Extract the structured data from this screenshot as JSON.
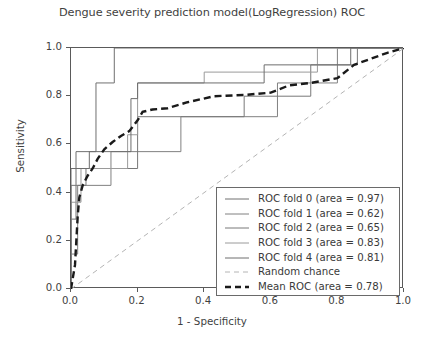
{
  "chart_data": {
    "type": "line",
    "title": "Dengue severity prediction model(LogRegression) ROC",
    "xlabel": "1 - Specificity",
    "ylabel": "Sensitivity",
    "xlim": [
      0.0,
      1.0
    ],
    "ylim": [
      0.0,
      1.0
    ],
    "xticks": [
      "0.0",
      "0.2",
      "0.4",
      "0.6",
      "0.8",
      "1.0"
    ],
    "yticks": [
      "0.0",
      "0.2",
      "0.4",
      "0.6",
      "0.8",
      "1.0"
    ],
    "grid": false,
    "legend_position": "lower right",
    "series": [
      {
        "name": "ROC fold 0 (area = 0.97)",
        "area": 0.97,
        "style": "step-solid",
        "color": "#707070",
        "width": 1.0,
        "points": [
          [
            0.0,
            0.0
          ],
          [
            0.0,
            0.29
          ],
          [
            0.015,
            0.29
          ],
          [
            0.015,
            0.57
          ],
          [
            0.075,
            0.57
          ],
          [
            0.075,
            0.855
          ],
          [
            0.13,
            0.855
          ],
          [
            0.13,
            1.0
          ],
          [
            1.0,
            1.0
          ]
        ]
      },
      {
        "name": "ROC fold 1 (area = 0.62)",
        "area": 0.62,
        "style": "step-solid",
        "color": "#808080",
        "width": 1.0,
        "points": [
          [
            0.0,
            0.0
          ],
          [
            0.0,
            0.145
          ],
          [
            0.02,
            0.145
          ],
          [
            0.02,
            0.43
          ],
          [
            0.12,
            0.43
          ],
          [
            0.12,
            0.57
          ],
          [
            0.33,
            0.57
          ],
          [
            0.33,
            0.715
          ],
          [
            0.62,
            0.715
          ],
          [
            0.62,
            0.855
          ],
          [
            0.8,
            0.855
          ],
          [
            0.8,
            1.0
          ],
          [
            1.0,
            1.0
          ]
        ]
      },
      {
        "name": "ROC fold 2 (area = 0.65)",
        "area": 0.65,
        "style": "step-solid",
        "color": "#787878",
        "width": 1.0,
        "points": [
          [
            0.0,
            0.0
          ],
          [
            0.0,
            0.43
          ],
          [
            0.045,
            0.43
          ],
          [
            0.045,
            0.5
          ],
          [
            0.2,
            0.5
          ],
          [
            0.2,
            0.715
          ],
          [
            0.52,
            0.715
          ],
          [
            0.52,
            0.8
          ],
          [
            0.72,
            0.8
          ],
          [
            0.72,
            0.93
          ],
          [
            0.86,
            0.93
          ],
          [
            0.86,
            1.0
          ],
          [
            1.0,
            1.0
          ]
        ]
      },
      {
        "name": "ROC fold 3 (area = 0.83)",
        "area": 0.83,
        "style": "step-solid",
        "color": "#9a9a9a",
        "width": 1.0,
        "points": [
          [
            0.0,
            0.0
          ],
          [
            0.0,
            0.36
          ],
          [
            0.03,
            0.36
          ],
          [
            0.03,
            0.5
          ],
          [
            0.17,
            0.5
          ],
          [
            0.17,
            0.64
          ],
          [
            0.2,
            0.64
          ],
          [
            0.2,
            0.855
          ],
          [
            0.4,
            0.855
          ],
          [
            0.4,
            0.9
          ],
          [
            0.74,
            0.9
          ],
          [
            0.74,
            1.0
          ],
          [
            1.0,
            1.0
          ]
        ]
      },
      {
        "name": "ROC fold 4 (area = 0.81)",
        "area": 0.81,
        "style": "step-solid",
        "color": "#6e6e6e",
        "width": 1.0,
        "points": [
          [
            0.0,
            0.0
          ],
          [
            0.0,
            0.5
          ],
          [
            0.055,
            0.5
          ],
          [
            0.055,
            0.57
          ],
          [
            0.18,
            0.57
          ],
          [
            0.18,
            0.79
          ],
          [
            0.2,
            0.79
          ],
          [
            0.2,
            0.855
          ],
          [
            0.58,
            0.855
          ],
          [
            0.58,
            0.93
          ],
          [
            0.84,
            0.93
          ],
          [
            0.84,
            1.0
          ],
          [
            1.0,
            1.0
          ]
        ]
      },
      {
        "name": "Random chance",
        "style": "dashed",
        "color": "#b4b4b4",
        "width": 1.0,
        "points": [
          [
            0.0,
            0.0
          ],
          [
            1.0,
            1.0
          ]
        ]
      },
      {
        "name": "Mean ROC (area = 0.78)",
        "area": 0.78,
        "style": "dashed-bold",
        "color": "#1a1a1a",
        "width": 2.4,
        "points": [
          [
            0.0,
            0.0
          ],
          [
            0.012,
            0.1
          ],
          [
            0.016,
            0.2
          ],
          [
            0.02,
            0.3
          ],
          [
            0.025,
            0.38
          ],
          [
            0.035,
            0.43
          ],
          [
            0.05,
            0.47
          ],
          [
            0.065,
            0.5
          ],
          [
            0.08,
            0.54
          ],
          [
            0.1,
            0.58
          ],
          [
            0.125,
            0.61
          ],
          [
            0.15,
            0.635
          ],
          [
            0.175,
            0.655
          ],
          [
            0.2,
            0.7
          ],
          [
            0.215,
            0.735
          ],
          [
            0.245,
            0.745
          ],
          [
            0.29,
            0.75
          ],
          [
            0.35,
            0.775
          ],
          [
            0.43,
            0.8
          ],
          [
            0.52,
            0.805
          ],
          [
            0.6,
            0.815
          ],
          [
            0.655,
            0.845
          ],
          [
            0.72,
            0.855
          ],
          [
            0.8,
            0.875
          ],
          [
            0.85,
            0.93
          ],
          [
            0.9,
            0.955
          ],
          [
            0.95,
            0.98
          ],
          [
            1.0,
            1.0
          ]
        ]
      }
    ]
  },
  "legend": {
    "entries": [
      {
        "label": "ROC fold 0 (area = 0.97)"
      },
      {
        "label": "ROC fold 1 (area = 0.62)"
      },
      {
        "label": "ROC fold 2 (area = 0.65)"
      },
      {
        "label": "ROC fold 3 (area = 0.83)"
      },
      {
        "label": "ROC fold 4 (area = 0.81)"
      },
      {
        "label": "Random chance"
      },
      {
        "label": "Mean ROC (area = 0.78)"
      }
    ]
  }
}
